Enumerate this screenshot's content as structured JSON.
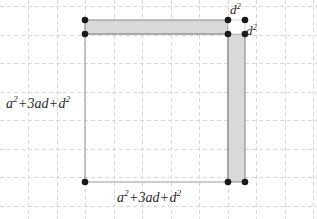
{
  "figure": {
    "canvas": {
      "width": 317,
      "height": 219,
      "background": "#ffffff"
    },
    "grid": {
      "visible": true,
      "style": "dashed",
      "color": "#d8d8dc",
      "x_lines": [
        28,
        57,
        85,
        114,
        142,
        171,
        199,
        228,
        256,
        285,
        313
      ],
      "y_lines": [
        6,
        35,
        63,
        92,
        120,
        149,
        177,
        206
      ]
    },
    "colors": {
      "shape_fill": "#d9d9d9",
      "shape_stroke": "#8a8a8a",
      "outline_stroke": "#9a9a9a",
      "vertex_dot": "#1a1a1a",
      "text": "#2b2b2b",
      "grid": "#d8d8dc"
    },
    "shapes": {
      "horizontal_strip": {
        "name": "top-horizontal-strip",
        "filled": true,
        "points": "85,20 228,20 228,34 85,34"
      },
      "vertical_strip": {
        "name": "right-vertical-strip",
        "filled": true,
        "points": "228,34 245,34 245,182 228,182"
      },
      "main_outline": {
        "name": "main-rectangle-outline",
        "filled": false,
        "points": "85,34 228,34 228,182 85,182"
      }
    },
    "vertices": [
      {
        "name": "top-left-upper",
        "x": 85,
        "y": 20
      },
      {
        "name": "top-left-lower",
        "x": 85,
        "y": 34
      },
      {
        "name": "top-right-inner-upper",
        "x": 228,
        "y": 20
      },
      {
        "name": "top-right-inner-lower",
        "x": 228,
        "y": 34
      },
      {
        "name": "top-right-outer-upper",
        "x": 245,
        "y": 20
      },
      {
        "name": "top-right-outer-lower",
        "x": 245,
        "y": 34
      },
      {
        "name": "bottom-left",
        "x": 85,
        "y": 182
      },
      {
        "name": "bottom-right-inner",
        "x": 228,
        "y": 182
      },
      {
        "name": "bottom-right-outer",
        "x": 245,
        "y": 182
      }
    ],
    "labels": {
      "left_side": {
        "id": "label-left",
        "text": "a² + 3ad + d²",
        "terms": [
          "a",
          "2",
          "+",
          "3ad",
          "+",
          "d",
          "2"
        ],
        "x": 6,
        "y": 97
      },
      "bottom_side": {
        "id": "label-bottom",
        "text": "a² + 3ad + d²",
        "terms": [
          "a",
          "2",
          "+",
          "3ad",
          "+",
          "d",
          "2"
        ],
        "x": 117,
        "y": 191
      },
      "d_squared_top": {
        "id": "label-d2-top",
        "text": "d²",
        "base": "d",
        "exponent": "2",
        "x": 230,
        "y": 3
      },
      "d_squared_right": {
        "id": "label-d2-right",
        "text": "d²",
        "base": "d",
        "exponent": "2",
        "x": 246,
        "y": 24
      }
    }
  }
}
